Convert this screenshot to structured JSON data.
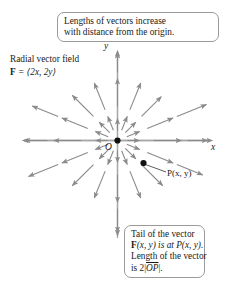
{
  "figure": {
    "title_note_top": {
      "line1": "Lengths of vectors increase",
      "line2": "with distance from the origin."
    },
    "field_label": {
      "line1": "Radial vector field",
      "line2_prefix": "F",
      "line2_body": " = ⟨2x, 2y⟩"
    },
    "note_bottom": {
      "line1": "Tail of the vector",
      "line2_bold": "F",
      "line2_rest": "(x, y) is at P(x, y).",
      "line3": "Length of the vector",
      "line4_prefix": "is 2",
      "line4_bar_open": "|",
      "line4_op": "OP",
      "line4_bar_close": "|",
      "line4_suffix": "."
    },
    "axes": {
      "x_label": "x",
      "y_label": "y"
    },
    "points": {
      "origin_label": "O",
      "p_label": "P(x, y)"
    },
    "colors": {
      "vector": "#8a8a8a",
      "axis": "#a8a8a8",
      "text": "#1a1a1a",
      "box_border": "#9a9a9a",
      "dot": "#111111"
    }
  },
  "chart_data": {
    "type": "scatter",
    "title": "Radial vector field F = ⟨2x, 2y⟩",
    "xlabel": "x",
    "ylabel": "y",
    "grid": false,
    "legend": null,
    "origin_px": [
      117,
      140
    ],
    "point_P_px": [
      143,
      163
    ],
    "axis_extent_px": {
      "x_min": 22,
      "x_max": 210,
      "y_min": 50,
      "y_max": 238
    },
    "vector_scale": 2.0,
    "vectors": [
      {
        "angle_deg": 0,
        "r0": 10,
        "r1": 22
      },
      {
        "angle_deg": 0,
        "r0": 36,
        "r1": 64
      },
      {
        "angle_deg": 0,
        "r0": 70,
        "r1": 95
      },
      {
        "angle_deg": 22,
        "r0": 10,
        "r1": 24
      },
      {
        "angle_deg": 22,
        "r0": 32,
        "r1": 60
      },
      {
        "angle_deg": 22,
        "r0": 64,
        "r1": 96
      },
      {
        "angle_deg": 45,
        "r0": 11,
        "r1": 26
      },
      {
        "angle_deg": 45,
        "r0": 34,
        "r1": 62
      },
      {
        "angle_deg": 68,
        "r0": 11,
        "r1": 26
      },
      {
        "angle_deg": 68,
        "r0": 33,
        "r1": 62
      },
      {
        "angle_deg": 90,
        "r0": 10,
        "r1": 22
      },
      {
        "angle_deg": 90,
        "r0": 34,
        "r1": 62
      },
      {
        "angle_deg": 90,
        "r0": 68,
        "r1": 90
      },
      {
        "angle_deg": 112,
        "r0": 11,
        "r1": 26
      },
      {
        "angle_deg": 112,
        "r0": 33,
        "r1": 62
      },
      {
        "angle_deg": 135,
        "r0": 11,
        "r1": 26
      },
      {
        "angle_deg": 135,
        "r0": 34,
        "r1": 64
      },
      {
        "angle_deg": 158,
        "r0": 10,
        "r1": 24
      },
      {
        "angle_deg": 158,
        "r0": 32,
        "r1": 60
      },
      {
        "angle_deg": 158,
        "r0": 64,
        "r1": 92
      },
      {
        "angle_deg": 180,
        "r0": 10,
        "r1": 22
      },
      {
        "angle_deg": 180,
        "r0": 36,
        "r1": 64
      },
      {
        "angle_deg": 180,
        "r0": 70,
        "r1": 95
      },
      {
        "angle_deg": 202,
        "r0": 10,
        "r1": 24
      },
      {
        "angle_deg": 202,
        "r0": 32,
        "r1": 60
      },
      {
        "angle_deg": 202,
        "r0": 64,
        "r1": 96
      },
      {
        "angle_deg": 225,
        "r0": 11,
        "r1": 26
      },
      {
        "angle_deg": 225,
        "r0": 34,
        "r1": 64
      },
      {
        "angle_deg": 248,
        "r0": 11,
        "r1": 26
      },
      {
        "angle_deg": 248,
        "r0": 33,
        "r1": 62
      },
      {
        "angle_deg": 270,
        "r0": 10,
        "r1": 22
      },
      {
        "angle_deg": 270,
        "r0": 34,
        "r1": 62
      },
      {
        "angle_deg": 270,
        "r0": 68,
        "r1": 92
      },
      {
        "angle_deg": 292,
        "r0": 11,
        "r1": 26
      },
      {
        "angle_deg": 292,
        "r0": 33,
        "r1": 62
      },
      {
        "angle_deg": 315,
        "r0": 11,
        "r1": 26
      },
      {
        "angle_deg": 315,
        "r0": 34,
        "r1": 64
      },
      {
        "angle_deg": 338,
        "r0": 10,
        "r1": 24
      },
      {
        "angle_deg": 338,
        "r0": 32,
        "r1": 60
      },
      {
        "angle_deg": 338,
        "r0": 64,
        "r1": 92
      }
    ]
  }
}
